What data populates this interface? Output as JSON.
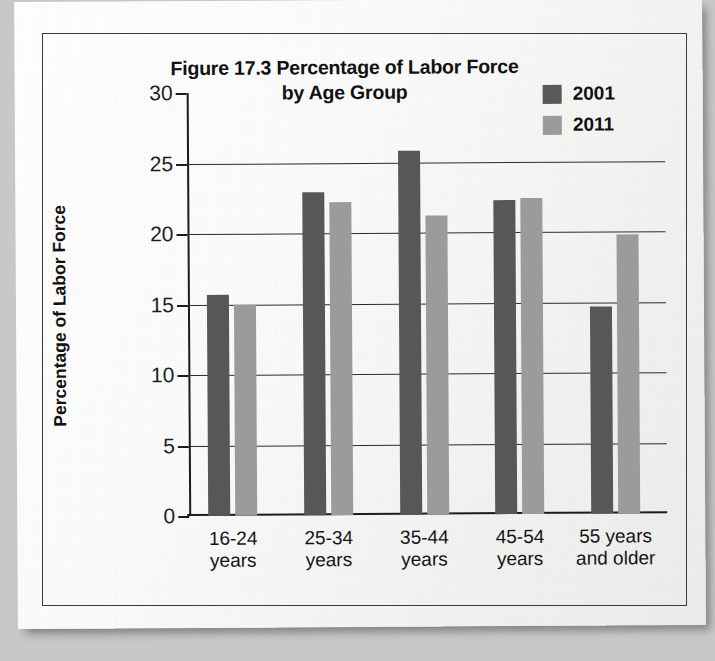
{
  "figure": {
    "title_line1": "Figure 17.3 Percentage of Labor Force",
    "title_line2": "by Age Group"
  },
  "colors": {
    "series_2001": "#575757",
    "series_2011": "#9b9b9b",
    "axis": "#1c1c1c",
    "grid": "#2b2b2b",
    "page": "#ffffff"
  },
  "legend": {
    "position": "top-right",
    "entries": [
      {
        "label": "2001",
        "color": "#575757"
      },
      {
        "label": "2011",
        "color": "#9b9b9b"
      }
    ]
  },
  "axes": {
    "y_title": "Percentage of Labor Force",
    "y_ticks": [
      "30",
      "25",
      "20",
      "15",
      "10",
      "5",
      "0"
    ],
    "x_title": ""
  },
  "chart_data": {
    "type": "bar",
    "title": "Figure 17.3 Percentage of Labor Force by Age Group",
    "xlabel": "",
    "ylabel": "Percentage of Labor Force",
    "ylim": [
      0,
      30
    ],
    "ytick_step": 5,
    "grid": true,
    "legend_position": "top-right",
    "categories": [
      "16-24 years",
      "25-34 years",
      "35-44 years",
      "45-54 years",
      "55 years and older"
    ],
    "category_lines": [
      [
        "16-24",
        "years"
      ],
      [
        "25-34",
        "years"
      ],
      [
        "35-44",
        "years"
      ],
      [
        "45-54",
        "years"
      ],
      [
        "55 years",
        "and older"
      ]
    ],
    "series": [
      {
        "name": "2001",
        "color": "#575757",
        "values": [
          15.7,
          22.9,
          25.8,
          22.3,
          14.7
        ]
      },
      {
        "name": "2011",
        "color": "#9b9b9b",
        "values": [
          15.0,
          22.2,
          21.2,
          22.4,
          19.8
        ]
      }
    ]
  }
}
